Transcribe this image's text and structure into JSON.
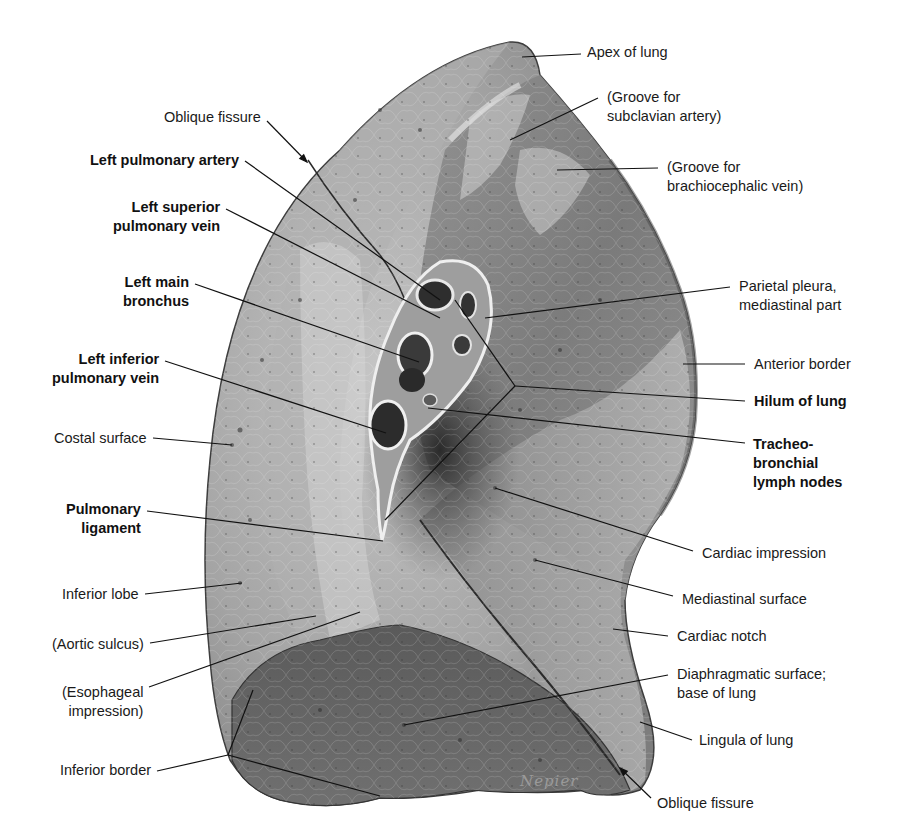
{
  "figure": {
    "signature": "Nepier",
    "colors": {
      "background": "#ffffff",
      "lung_light": "#b9b9b9",
      "lung_mid": "#8c8c8c",
      "lung_dark": "#555555",
      "hilum_dark": "#2e2e2e",
      "text": "#1a1a1a",
      "leader": "#111111"
    }
  },
  "labels": [
    {
      "id": "apex-of-lung",
      "text": "Apex of lung",
      "bold": false,
      "side": "right",
      "x": 587,
      "y": 43,
      "line": [
        [
          581,
          54
        ],
        [
          522,
          57
        ]
      ]
    },
    {
      "id": "groove-subclavian",
      "text": "(Groove for\nsubclavian artery)",
      "bold": false,
      "side": "right",
      "x": 607,
      "y": 88,
      "line": [
        [
          598,
          98
        ],
        [
          510,
          140
        ]
      ]
    },
    {
      "id": "oblique-fissure-top",
      "text": "Oblique fissure",
      "bold": false,
      "side": "left",
      "x": 150,
      "y": 108,
      "arrow": true,
      "line": [
        [
          267,
          121
        ],
        [
          307,
          162
        ]
      ]
    },
    {
      "id": "groove-brachiocephalic",
      "text": "(Groove for\nbrachiocephalic vein)",
      "bold": false,
      "side": "right",
      "x": 667,
      "y": 158,
      "line": [
        [
          658,
          168
        ],
        [
          557,
          170
        ]
      ]
    },
    {
      "id": "left-pulmonary-artery",
      "text": "Left pulmonary artery",
      "bold": true,
      "side": "left",
      "x": 66,
      "y": 151,
      "line": [
        [
          245,
          161
        ],
        [
          440,
          300
        ]
      ]
    },
    {
      "id": "left-superior-pulmonary-vein",
      "text": "Left superior\npulmonary vein",
      "bold": true,
      "side": "left",
      "x": 97,
      "y": 198,
      "line": [
        [
          226,
          209
        ],
        [
          440,
          318
        ]
      ]
    },
    {
      "id": "left-main-bronchus",
      "text": "Left main\nbronchus",
      "bold": true,
      "side": "left",
      "x": 109,
      "y": 273,
      "line": [
        [
          195,
          284
        ],
        [
          419,
          362
        ]
      ]
    },
    {
      "id": "parietal-pleura",
      "text": "Parietal pleura,\nmediastinal part",
      "bold": false,
      "side": "right",
      "x": 739,
      "y": 277,
      "line": [
        [
          730,
          287
        ],
        [
          485,
          318
        ]
      ]
    },
    {
      "id": "left-inferior-pulmonary-vein",
      "text": "Left inferior\npulmonary vein",
      "bold": true,
      "side": "left",
      "x": 37,
      "y": 350,
      "line": [
        [
          165,
          361
        ],
        [
          386,
          433
        ]
      ]
    },
    {
      "id": "anterior-border",
      "text": "Anterior border",
      "bold": false,
      "side": "right",
      "x": 754,
      "y": 355,
      "line": [
        [
          745,
          364
        ],
        [
          683,
          364
        ]
      ]
    },
    {
      "id": "hilum-of-lung",
      "text": "Hilum of lung",
      "bold": true,
      "side": "right",
      "x": 754,
      "y": 392,
      "line": [
        [
          745,
          401
        ],
        [
          515,
          386
        ]
      ],
      "extra_lines": [
        [
          [
            515,
            386
          ],
          [
            455,
            300
          ]
        ],
        [
          [
            515,
            386
          ],
          [
            385,
            520
          ]
        ]
      ]
    },
    {
      "id": "costal-surface",
      "text": "Costal surface",
      "bold": false,
      "side": "left",
      "x": 40,
      "y": 429,
      "line": [
        [
          153,
          438
        ],
        [
          232,
          445
        ]
      ]
    },
    {
      "id": "tracheobronchial-lymph-nodes",
      "text": "Tracheo-\nbronchial\nlymph nodes",
      "bold": true,
      "side": "right",
      "x": 753,
      "y": 435,
      "line": [
        [
          745,
          443
        ],
        [
          428,
          408
        ]
      ]
    },
    {
      "id": "pulmonary-ligament",
      "text": "Pulmonary\nligament",
      "bold": true,
      "side": "left",
      "x": 55,
      "y": 500,
      "line": [
        [
          147,
          511
        ],
        [
          383,
          541
        ]
      ]
    },
    {
      "id": "cardiac-impression",
      "text": "Cardiac impression",
      "bold": false,
      "side": "right",
      "x": 702,
      "y": 544,
      "line": [
        [
          693,
          551
        ],
        [
          495,
          488
        ]
      ]
    },
    {
      "id": "mediastinal-surface",
      "text": "Mediastinal surface",
      "bold": false,
      "side": "right",
      "x": 682,
      "y": 590,
      "line": [
        [
          673,
          596
        ],
        [
          535,
          560
        ]
      ]
    },
    {
      "id": "inferior-lobe",
      "text": "Inferior lobe",
      "bold": false,
      "side": "left",
      "x": 49,
      "y": 585,
      "line": [
        [
          145,
          594
        ],
        [
          242,
          583
        ]
      ]
    },
    {
      "id": "cardiac-notch",
      "text": "Cardiac notch",
      "bold": false,
      "side": "right",
      "x": 677,
      "y": 627,
      "line": [
        [
          668,
          636
        ],
        [
          613,
          629
        ]
      ]
    },
    {
      "id": "aortic-sulcus",
      "text": "(Aortic sulcus)",
      "bold": false,
      "side": "left",
      "x": 37,
      "y": 635,
      "line": [
        [
          150,
          643
        ],
        [
          316,
          616
        ]
      ]
    },
    {
      "id": "esophageal-impression",
      "text": "(Esophageal\nimpression)",
      "bold": false,
      "side": "left",
      "x": 51,
      "y": 683,
      "line": [
        [
          149,
          687
        ],
        [
          360,
          612
        ]
      ]
    },
    {
      "id": "diaphragmatic-surface",
      "text": "Diaphragmatic surface;\nbase of lung",
      "bold": false,
      "side": "right",
      "x": 677,
      "y": 665,
      "line": [
        [
          668,
          675
        ],
        [
          404,
          725
        ]
      ]
    },
    {
      "id": "lingula-of-lung",
      "text": "Lingula of lung",
      "bold": false,
      "side": "right",
      "x": 699,
      "y": 731,
      "line": [
        [
          692,
          740
        ],
        [
          640,
          722
        ]
      ]
    },
    {
      "id": "inferior-border",
      "text": "Inferior border",
      "bold": false,
      "side": "left",
      "x": 44,
      "y": 761,
      "line": [
        [
          157,
          771
        ],
        [
          228,
          755
        ]
      ],
      "extra_lines": [
        [
          [
            228,
            755
          ],
          [
            253,
            690
          ]
        ],
        [
          [
            228,
            755
          ],
          [
            380,
            796
          ]
        ]
      ]
    },
    {
      "id": "oblique-fissure-bottom",
      "text": "Oblique fissure",
      "bold": false,
      "side": "right",
      "x": 657,
      "y": 794,
      "arrow": true,
      "line": [
        [
          651,
          798
        ],
        [
          620,
          768
        ]
      ]
    }
  ]
}
